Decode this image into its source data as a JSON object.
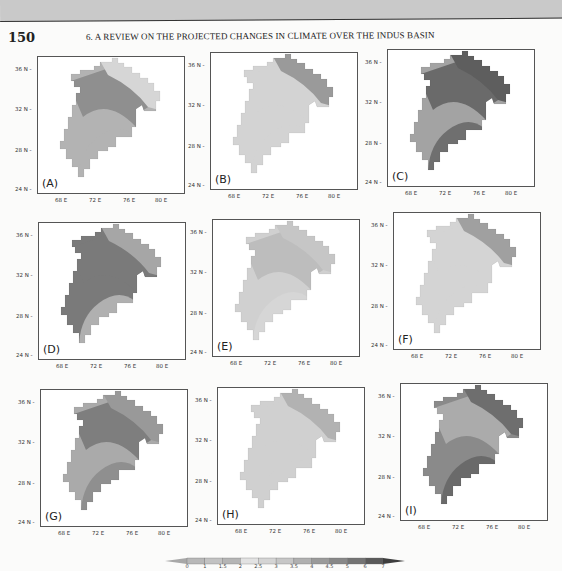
{
  "header": {
    "page_number": "150",
    "running_head": "6. A REVIEW ON THE PROJECTED CHANGES IN CLIMATE OVER THE INDUS BASIN"
  },
  "axes": {
    "y_ticks": [
      "36 N",
      "32 N",
      "28 N",
      "24 N"
    ],
    "x_ticks": [
      "68 E",
      "72 E",
      "76 E",
      "80 E"
    ]
  },
  "panels": [
    {
      "label": "(A)",
      "shade_base": "#b3b3b3",
      "shade_mid": "#8f8f8f",
      "shade_north": "#d6d6d6",
      "shade_south": "#b3b3b3"
    },
    {
      "label": "(B)",
      "shade_base": "#d3d3d3",
      "shade_mid": "#d3d3d3",
      "shade_north": "#9a9a9a",
      "shade_south": "#d3d3d3"
    },
    {
      "label": "(C)",
      "shade_base": "#a3a3a3",
      "shade_mid": "#6a6a6a",
      "shade_north": "#5e5e5e",
      "shade_south": "#6f6f6f"
    },
    {
      "label": "(D)",
      "shade_base": "#7a7a7a",
      "shade_mid": "#7a7a7a",
      "shade_north": "#a6a6a6",
      "shade_south": "#b0b0b0"
    },
    {
      "label": "(E)",
      "shade_base": "#d0d0d0",
      "shade_mid": "#bdbdbd",
      "shade_north": "#c6c6c6",
      "shade_south": "#d6d6d6"
    },
    {
      "label": "(F)",
      "shade_base": "#d4d4d4",
      "shade_mid": "#d4d4d4",
      "shade_north": "#a0a0a0",
      "shade_south": "#d4d4d4"
    },
    {
      "label": "(G)",
      "shade_base": "#aaaaaa",
      "shade_mid": "#7e7e7e",
      "shade_north": "#999999",
      "shade_south": "#8f8f8f"
    },
    {
      "label": "(H)",
      "shade_base": "#d0d0d0",
      "shade_mid": "#d0d0d0",
      "shade_north": "#b2b2b2",
      "shade_south": "#d0d0d0"
    },
    {
      "label": "(I)",
      "shade_base": "#8a8a8a",
      "shade_mid": "#ababab",
      "shade_north": "#6e6e6e",
      "shade_south": "#6a6a6a"
    }
  ],
  "colorbar": {
    "ticks": [
      "0",
      "1",
      "1.5",
      "2",
      "2.5",
      "3",
      "3.5",
      "4",
      "4.5",
      "5",
      "6",
      "7"
    ],
    "colors": [
      "#a8a8a8",
      "#b8b8b8",
      "#c2c2c2",
      "#b5b5b5",
      "#e2e2e2",
      "#d4d4d4",
      "#c6c6c6",
      "#b0b0b0",
      "#9a9a9a",
      "#888888",
      "#747474",
      "#5a5a5a",
      "#3e3e3e"
    ]
  },
  "chart_data": {
    "type": "heatmap",
    "panels": [
      "(A)",
      "(B)",
      "(C)",
      "(D)",
      "(E)",
      "(F)",
      "(G)",
      "(H)",
      "(I)"
    ],
    "xlabel": "Longitude",
    "ylabel": "Latitude",
    "x_ticks": [
      "68 E",
      "72 E",
      "76 E",
      "80 E"
    ],
    "y_ticks": [
      "24 N",
      "28 N",
      "32 N",
      "36 N"
    ],
    "xlim": [
      65,
      82
    ],
    "ylim": [
      23,
      38
    ],
    "colorbar_levels": [
      0,
      1,
      1.5,
      2,
      2.5,
      3,
      3.5,
      4,
      4.5,
      5,
      6,
      7
    ],
    "grid": false,
    "legend_position": "bottom"
  }
}
